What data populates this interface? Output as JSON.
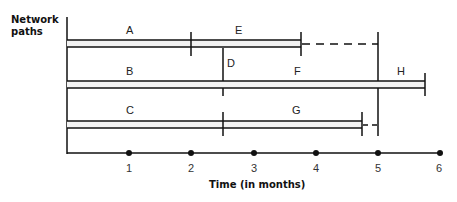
{
  "diagram": {
    "y_axis_label_line1": "Network",
    "y_axis_label_line2": "paths",
    "x_axis_label": "Time (in months)",
    "ticks": [
      "1",
      "2",
      "3",
      "4",
      "5",
      "6"
    ],
    "activities": [
      {
        "label": "A",
        "path": 1,
        "start": 0,
        "end": 2
      },
      {
        "label": "E",
        "path": 1,
        "start": 2,
        "end": 3.8,
        "slack_to": 5
      },
      {
        "label": "D",
        "type": "dependency",
        "at": 2.5
      },
      {
        "label": "B",
        "path": 2,
        "start": 0,
        "end": 2.5
      },
      {
        "label": "F",
        "path": 2,
        "start": 2.5,
        "end": 5
      },
      {
        "label": "H",
        "path": 2,
        "start": 5,
        "end": 5.8
      },
      {
        "label": "C",
        "path": 3,
        "start": 0,
        "end": 2.5
      },
      {
        "label": "G",
        "path": 3,
        "start": 2.5,
        "end": 4.75,
        "slack_to": 5
      }
    ],
    "colors": {
      "line": "#111111",
      "bar_fill": "#f2f2f2"
    }
  }
}
